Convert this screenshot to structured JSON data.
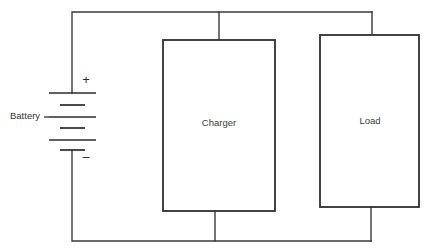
{
  "diagram": {
    "background_color": "#ffffff",
    "wire_color": "#3a3a3a",
    "box_stroke_color": "#2f2f2f",
    "text_color": "#333333",
    "battery": {
      "label": "Battery",
      "positive_symbol": "+",
      "negative_symbol": "–",
      "cell_count": 3,
      "plate_pairs": 3
    },
    "blocks": [
      {
        "name": "charger",
        "label": "Charger"
      },
      {
        "name": "load",
        "label": "Load"
      }
    ]
  }
}
